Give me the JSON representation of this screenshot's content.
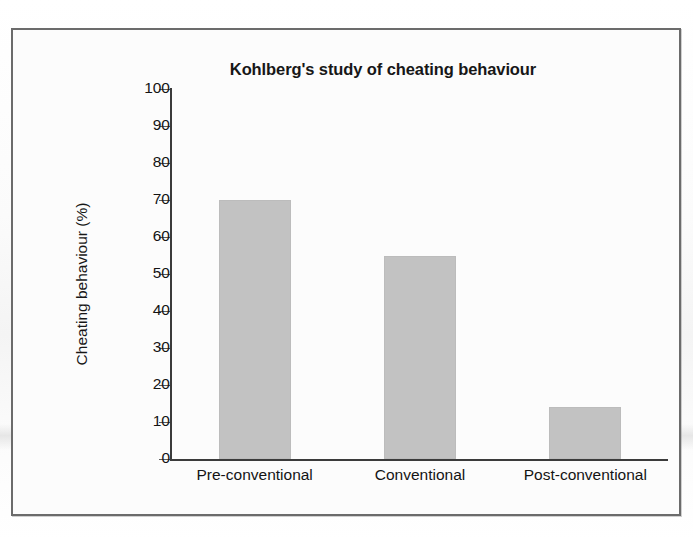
{
  "figure": {
    "title": "Kohlberg's study of cheating behaviour",
    "y_axis_title": "Cheating behaviour (%)",
    "bar_color": "#c2c2c2",
    "frame_color": "#6b6b6b",
    "axis_color": "#3b3b3b"
  },
  "chart_data": {
    "type": "bar",
    "title": "Kohlberg's study of cheating behaviour",
    "xlabel": "",
    "ylabel": "Cheating behaviour (%)",
    "categories": [
      "Pre-conventional",
      "Conventional",
      "Post-conventional"
    ],
    "values": [
      70,
      55,
      14
    ],
    "ylim": [
      0,
      100
    ],
    "ytick_labels": [
      "100",
      "90",
      "80",
      "70",
      "60",
      "50",
      "40",
      "30",
      "20",
      "10",
      "0"
    ],
    "ytick_values": [
      100,
      90,
      80,
      70,
      60,
      50,
      40,
      30,
      20,
      10,
      0
    ],
    "grid": false,
    "legend": "none"
  }
}
